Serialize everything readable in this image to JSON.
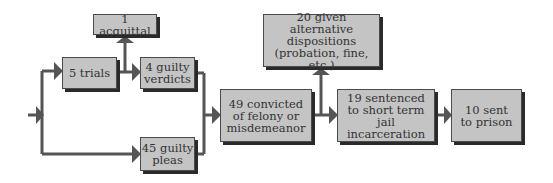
{
  "diagram": {
    "type": "flowchart",
    "nodes": [
      {
        "id": "acquittal",
        "label": "1 acquittal"
      },
      {
        "id": "trials",
        "label": "5 trials"
      },
      {
        "id": "guilty_verdicts",
        "label": "4 guilty\nverdicts"
      },
      {
        "id": "guilty_pleas",
        "label": "45 guilty\npleas"
      },
      {
        "id": "convicted",
        "label": "49 convicted\nof felony or\nmisdemeanor"
      },
      {
        "id": "alternative",
        "label": "20 given alternative\ndispositions\n(probation, fine, etc.)"
      },
      {
        "id": "sentenced",
        "label": "19 sentenced\nto short term\njail incarceration"
      },
      {
        "id": "prison",
        "label": "10 sent\nto prison"
      }
    ],
    "edges": [
      {
        "from": "start",
        "to": "trials"
      },
      {
        "from": "start",
        "to": "guilty_pleas"
      },
      {
        "from": "trials",
        "to": "guilty_verdicts"
      },
      {
        "from": "trials",
        "to": "acquittal"
      },
      {
        "from": "guilty_verdicts",
        "to": "convicted"
      },
      {
        "from": "guilty_pleas",
        "to": "convicted"
      },
      {
        "from": "convicted",
        "to": "sentenced"
      },
      {
        "from": "convicted",
        "to": "alternative"
      },
      {
        "from": "sentenced",
        "to": "prison"
      }
    ],
    "colors": {
      "box_fill": "#c4c4c4",
      "line": "#4a4a4a",
      "shadow": "#2a2a2a"
    }
  }
}
